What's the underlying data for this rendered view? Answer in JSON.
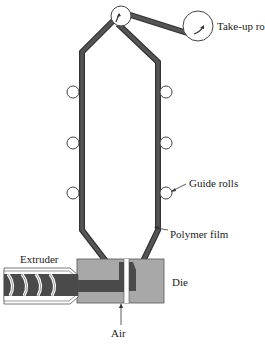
{
  "diagram": {
    "labels": {
      "take_up_roll": "Take-up roll",
      "guide_rolls": "Guide rolls",
      "polymer_film": "Polymer film",
      "extruder": "Extruder",
      "die": "Die",
      "air": "Air"
    },
    "colors": {
      "film": "#4a4a4a",
      "die": "#a8a8a8",
      "line": "#333333",
      "background": "#ffffff"
    }
  }
}
